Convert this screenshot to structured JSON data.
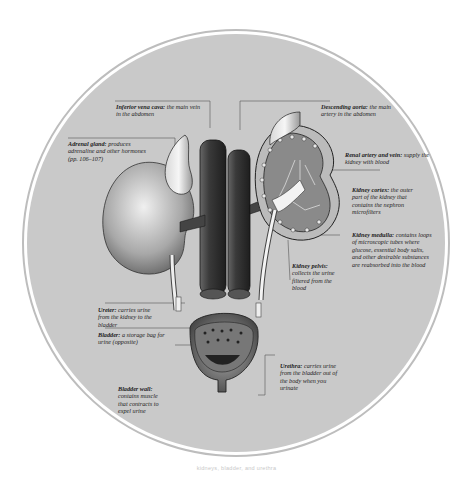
{
  "diagram": {
    "background_color": "#c9c9c9",
    "ring_color": "#b4b4b4",
    "labels": [
      {
        "id": "ivc",
        "term": "Inferior vena cava:",
        "desc": "the main vein in the abdomen"
      },
      {
        "id": "adrenal",
        "term": "Adrenal gland:",
        "desc": "produces adrenaline and other hormones (pp. 106–107)"
      },
      {
        "id": "aorta",
        "term": "Descending aorta:",
        "desc": "the main artery in the abdomen"
      },
      {
        "id": "renal",
        "term": "Renal artery and vein:",
        "desc": "supply the kidney with blood"
      },
      {
        "id": "cortex",
        "term": "Kidney cortex:",
        "desc": "the outer part of the kidney that contains the nephron microfilters"
      },
      {
        "id": "medulla",
        "term": "Kidney medulla:",
        "desc": "contains loops of microscopic tubes where glucose, essential body salts, and other desirable substances are reabsorbed into the blood"
      },
      {
        "id": "pelvis",
        "term": "Kidney pelvis:",
        "desc": "collects the urine filtered from the blood"
      },
      {
        "id": "ureter",
        "term": "Ureter:",
        "desc": "carries urine from the kidney to the bladder"
      },
      {
        "id": "bladder",
        "term": "Bladder:",
        "desc": "a storage bag for urine (opposite)"
      },
      {
        "id": "bladderwall",
        "term": "Bladder wall:",
        "desc": "contains muscle that contracts to expel urine"
      },
      {
        "id": "urethra",
        "term": "Urethra:",
        "desc": "carries urine from the bladder out of the body when you urinate"
      }
    ],
    "caption": "kidneys, bladder, and urethra"
  }
}
